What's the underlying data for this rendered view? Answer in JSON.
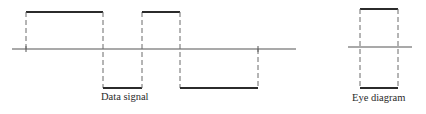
{
  "diagram": {
    "data_signal": {
      "caption": "Data signal",
      "levels": [
        "high",
        "low",
        "high",
        "low"
      ],
      "transitions_x": [
        26,
        103,
        142,
        180,
        258
      ],
      "axis": {
        "x1": 12,
        "x2": 296,
        "y": 49
      },
      "high_y": 12,
      "low_y": 88
    },
    "eye_diagram": {
      "caption": "Eye diagram",
      "left_x": 360,
      "right_x": 398,
      "top_y": 9,
      "bottom_y": 88,
      "axis": {
        "x1": 348,
        "x2": 412,
        "y": 47
      }
    },
    "colors": {
      "line": "#2b2b2b",
      "axis": "#555555",
      "dashed": "#6a6a6a"
    }
  }
}
